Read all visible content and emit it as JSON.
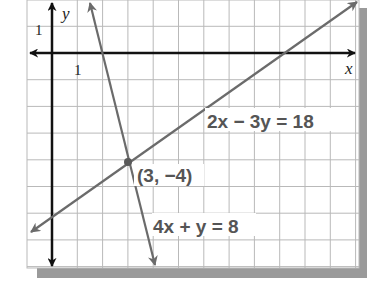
{
  "figure": {
    "type": "coordinate-plane-system-of-equations",
    "axes": {
      "x_label": "x",
      "y_label": "y",
      "x_tick_label": "1",
      "y_tick_label": "1",
      "x_range": [
        -1,
        12
      ],
      "y_range": [
        -8,
        2
      ]
    },
    "lines": [
      {
        "equation_label": "2x − 3y = 18",
        "slope": 0.6667,
        "intercept": -6,
        "color": "#6b6b6b"
      },
      {
        "equation_label": "4x + y = 8",
        "slope": -4,
        "intercept": 8,
        "color": "#6b6b6b"
      }
    ],
    "intersection": {
      "label": "(3, −4)",
      "x": 3,
      "y": -4
    },
    "colors": {
      "grid": "#b9b9b9",
      "axis": "#111111",
      "line": "#6b6b6b",
      "label_text": "#555555",
      "shadow": "#9a9a9a",
      "point": "#5a5a5a"
    }
  }
}
